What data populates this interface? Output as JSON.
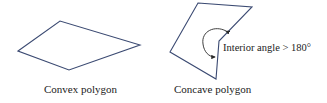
{
  "diagram": {
    "colors": {
      "polygon_stroke": "#3b4a72",
      "text": "#222222",
      "arrow": "#2a2a2a",
      "background": "#ffffff"
    },
    "convex": {
      "caption": "Convex polygon",
      "vertex_count": 4
    },
    "concave": {
      "caption": "Concave polygon",
      "vertex_count": 5,
      "annotation": "Interior angle > 180°",
      "reflex_angle_marker": "curved-arrow-icon"
    }
  }
}
